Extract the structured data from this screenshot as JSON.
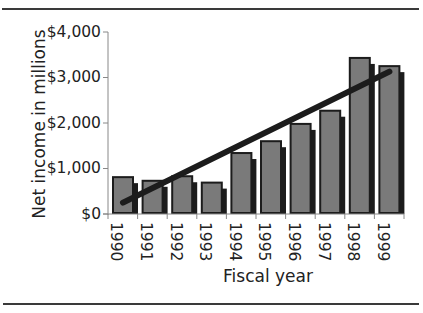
{
  "chart_data": {
    "type": "bar",
    "title": "",
    "xlabel": "Fiscal year",
    "ylabel": "Net income in millions",
    "categories": [
      "1990",
      "1991",
      "1992",
      "1993",
      "1994",
      "1995",
      "1996",
      "1997",
      "1998",
      "1999"
    ],
    "series": [
      {
        "name": "Net income",
        "type": "bar",
        "values": [
          810,
          730,
          830,
          690,
          1340,
          1600,
          1980,
          2270,
          3430,
          3250
        ]
      },
      {
        "name": "Trend",
        "type": "line",
        "values": [
          250,
          570,
          890,
          1210,
          1530,
          1850,
          2170,
          2490,
          2810,
          3130
        ]
      }
    ],
    "yticks": [
      "$0",
      "$1,000",
      "$2,000",
      "$3,000",
      "$4,000"
    ],
    "ytick_values": [
      0,
      1000,
      2000,
      3000,
      4000
    ],
    "ylim": [
      0,
      4000
    ],
    "grid": false,
    "legend": null,
    "colors": {
      "bar": "#7a7a7a",
      "bar_border": "#1c1c1c",
      "trend": "#1c1c1c"
    }
  }
}
